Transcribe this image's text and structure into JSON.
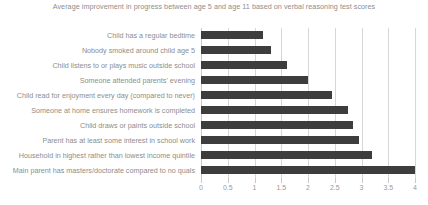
{
  "chart_data": {
    "type": "bar",
    "orientation": "horizontal",
    "title": "Average improvement in progress between age 5 and age 11 based on verbal reasoning test scores",
    "xlabel": "",
    "ylabel": "",
    "xlim": [
      0,
      4
    ],
    "grid": true,
    "legend": null,
    "xticks": [
      "0",
      "0.5",
      "1",
      "1.5",
      "2",
      "2.5",
      "3",
      "3.5",
      "4"
    ],
    "xtick_values": [
      0,
      0.5,
      1,
      1.5,
      2,
      2.5,
      3,
      3.5,
      4
    ],
    "bar_color": "#3d3d3d",
    "grid_color": "#d6d6d6",
    "text_color": "#8d8d8d",
    "categories": [
      "Child has a regular bedtime",
      "Nobody smoked around child age 5",
      "Child listens to or plays music outside school",
      "Someone attended parents' evening",
      "Child read for enjoyment every day (compared to never)",
      "Someone at home ensures homework is completed",
      "Child draws or paints outside school",
      "Parent has at least some interest in school work",
      "Household in highest rather than lowest income quintile",
      "Main parent has masters/doctorate compared to no quals"
    ],
    "values": [
      1.15,
      1.3,
      1.6,
      2.0,
      2.45,
      2.75,
      2.85,
      2.95,
      3.2,
      4.0
    ]
  }
}
